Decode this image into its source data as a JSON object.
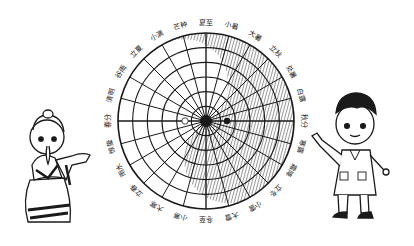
{
  "diagram": {
    "solar_terms": [
      "夏至",
      "小暑",
      "大暑",
      "立秋",
      "处暑",
      "白露",
      "秋分",
      "寒露",
      "霜降",
      "立冬",
      "小雪",
      "大雪",
      "冬至",
      "小寒",
      "大寒",
      "立春",
      "雨水",
      "惊蛰",
      "春分",
      "清明",
      "谷雨",
      "立夏",
      "小满",
      "芒种"
    ],
    "ring_count": 6,
    "spoke_count": 24,
    "colors": {
      "ink": "#1a1a1a",
      "background": "#ffffff"
    }
  },
  "characters": [
    {
      "name": "ancient-scholar",
      "description": "古代学者"
    },
    {
      "name": "modern-scientist",
      "description": "现代科学家"
    }
  ]
}
